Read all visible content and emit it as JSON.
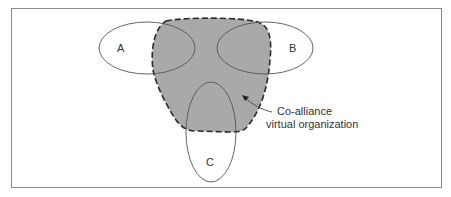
{
  "diagram": {
    "nodes": [
      {
        "id": "A",
        "label": "A",
        "shape": "ellipse"
      },
      {
        "id": "B",
        "label": "B",
        "shape": "ellipse"
      },
      {
        "id": "C",
        "label": "C",
        "shape": "ellipse"
      }
    ],
    "region": {
      "label_line1": "Co-alliance",
      "label_line2": "virtual organization",
      "fill": "#a9a9a9",
      "border": "dashed"
    },
    "colors": {
      "stroke": "#555555",
      "region_fill": "#a9a9a9",
      "frame": "#8a8a8a"
    }
  }
}
